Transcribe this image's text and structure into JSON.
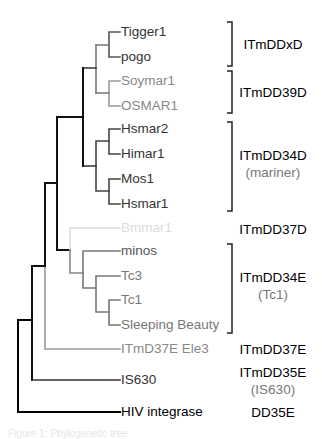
{
  "diagram": {
    "type": "phylogenetic-tree",
    "colors": {
      "black": "#111111",
      "dark_gray": "#555555",
      "mid_gray": "#888888",
      "light_gray": "#dddddd"
    },
    "leaves": [
      {
        "id": "tigger1",
        "label": "Tigger1",
        "y": 32,
        "x": 121,
        "color": "#333333"
      },
      {
        "id": "pogo",
        "label": "pogo",
        "y": 57,
        "x": 121,
        "color": "#333333"
      },
      {
        "id": "soymar1",
        "label": "Soymar1",
        "y": 81,
        "x": 121,
        "color": "#888888"
      },
      {
        "id": "osmar1",
        "label": "OSMAR1",
        "y": 106,
        "x": 121,
        "color": "#888888"
      },
      {
        "id": "hsmar2",
        "label": "Hsmar2",
        "y": 129,
        "x": 121,
        "color": "#333333"
      },
      {
        "id": "himar1",
        "label": "Himar1",
        "y": 154,
        "x": 121,
        "color": "#333333"
      },
      {
        "id": "mos1",
        "label": "Mos1",
        "y": 179,
        "x": 121,
        "color": "#333333"
      },
      {
        "id": "hsmar1",
        "label": "Hsmar1",
        "y": 204,
        "x": 121,
        "color": "#333333"
      },
      {
        "id": "bmmar1",
        "label": "Bmmar1",
        "y": 228,
        "x": 121,
        "color": "#dddddd"
      },
      {
        "id": "minos",
        "label": "minos",
        "y": 251,
        "x": 121,
        "color": "#555555"
      },
      {
        "id": "tc3",
        "label": "Tc3",
        "y": 276,
        "x": 121,
        "color": "#777777"
      },
      {
        "id": "tc1",
        "label": "Tc1",
        "y": 300,
        "x": 121,
        "color": "#777777"
      },
      {
        "id": "sleeping-beauty",
        "label": "Sleeping Beauty",
        "y": 325,
        "x": 121,
        "color": "#777777"
      },
      {
        "id": "itmd37e-ele3",
        "label": "ITmD37E Ele3",
        "y": 349,
        "x": 121,
        "color": "#888888"
      },
      {
        "id": "is630",
        "label": "IS630",
        "y": 380,
        "x": 121,
        "color": "#333333"
      },
      {
        "id": "hiv-integrase",
        "label": "HIV integrase",
        "y": 412,
        "x": 121,
        "color": "#000000"
      }
    ],
    "branches": [
      {
        "d": "M109 32 H120 M109 57 H120 M109 32 V57",
        "color": "#555555",
        "w": 1.6
      },
      {
        "d": "M109 81 H120 M109 106 H120 M109 81 V106",
        "color": "#999999",
        "w": 1.6
      },
      {
        "d": "M96 45 H109 M96 93 H109",
        "color": "#777777",
        "w": 1.6
      },
      {
        "d": "M96 45 V93",
        "color": "#777777",
        "w": 1.6
      },
      {
        "d": "M109 129 H120 M109 154 H120 M109 129 V154",
        "color": "#444444",
        "w": 1.6
      },
      {
        "d": "M109 179 H120 M109 204 H120 M109 179 V204",
        "color": "#444444",
        "w": 1.6
      },
      {
        "d": "M96 141 H109 M96 191 H109 M96 141 V191",
        "color": "#444444",
        "w": 1.6
      },
      {
        "d": "M83 68 H96 M83 166 H96",
        "color": "#333333",
        "w": 1.6
      },
      {
        "d": "M83 68 V166",
        "color": "#111111",
        "w": 2
      },
      {
        "d": "M57 117 H83 M57 117 V250 M57 250 H70",
        "color": "#111111",
        "w": 2
      },
      {
        "d": "M70 228 H120 M70 228 V250",
        "color": "#dddddd",
        "w": 1.6
      },
      {
        "d": "M70 250 V273 M70 273 H83",
        "color": "#888888",
        "w": 1.6
      },
      {
        "d": "M83 251 H120 M83 251 V288 M83 288 H96",
        "color": "#777777",
        "w": 1.6
      },
      {
        "d": "M96 276 H120 M96 276 V312 M96 312 H109",
        "color": "#777777",
        "w": 1.6
      },
      {
        "d": "M109 300 H120 M109 325 H120 M109 300 V325",
        "color": "#777777",
        "w": 1.6
      },
      {
        "d": "M45 183 H57 M45 183 V266",
        "color": "#111111",
        "w": 2
      },
      {
        "d": "M45 266 V349 M45 349 H120",
        "color": "#999999",
        "w": 1.6
      },
      {
        "d": "M32 266 H45 M32 266 V380",
        "color": "#111111",
        "w": 2
      },
      {
        "d": "M32 380 H120",
        "color": "#333333",
        "w": 1.6
      },
      {
        "d": "M18 320 H32 M18 320 V412 M18 412 H120",
        "color": "#000000",
        "w": 2
      }
    ],
    "brackets": [
      {
        "id": "itmddxd",
        "x": 232,
        "y1": 22,
        "y2": 66
      },
      {
        "id": "itmdd39d",
        "x": 232,
        "y1": 71,
        "y2": 113
      },
      {
        "id": "itmdd34d",
        "x": 232,
        "y1": 122,
        "y2": 211
      },
      {
        "id": "itmdd34e",
        "x": 232,
        "y1": 244,
        "y2": 333
      }
    ],
    "clades": [
      {
        "id": "itmddxd",
        "label": "ITmDDxD",
        "sub": "",
        "y": 44
      },
      {
        "id": "itmdd39d",
        "label": "ITmDD39D",
        "sub": "",
        "y": 92
      },
      {
        "id": "itmdd34d",
        "label": "ITmDD34D",
        "sub": "(mariner)",
        "y": 164
      },
      {
        "id": "itmdd37d",
        "label": "ITmDD37D",
        "sub": "",
        "y": 229
      },
      {
        "id": "itmdd34e",
        "label": "ITmDD34E",
        "sub": "(Tc1)",
        "y": 286
      },
      {
        "id": "itmdd37e",
        "label": "ITmDD37E",
        "sub": "",
        "y": 349
      },
      {
        "id": "itmdd35e",
        "label": "ITmDD35E",
        "sub": "(IS630)",
        "y": 381
      },
      {
        "id": "dd35e",
        "label": "DD35E",
        "sub": "",
        "y": 412
      }
    ],
    "caption": "Figure 1: Phylogenetic tree"
  }
}
